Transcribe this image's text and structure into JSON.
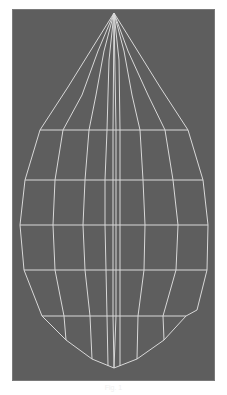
{
  "figure": {
    "type": "wireframe-mesh",
    "shape": "teardrop / leaf",
    "colors": {
      "background": "#ffffff",
      "viewport": "#5e5e5e",
      "wire": "#d8d8d8"
    },
    "apex": [
      114,
      13
    ],
    "bottom_tip": [
      114,
      368
    ],
    "rings": [
      {
        "y": 130,
        "points": [
          [
            40,
            130
          ],
          [
            63,
            130
          ],
          [
            89,
            130
          ],
          [
            107,
            130
          ],
          [
            113,
            130
          ],
          [
            116,
            130
          ],
          [
            120,
            130
          ],
          [
            140,
            130
          ],
          [
            165,
            130
          ],
          [
            188,
            130
          ]
        ]
      },
      {
        "y": 180,
        "points": [
          [
            25,
            180
          ],
          [
            55,
            180
          ],
          [
            85,
            180
          ],
          [
            105,
            180
          ],
          [
            113,
            180
          ],
          [
            116,
            180
          ],
          [
            120,
            180
          ],
          [
            143,
            180
          ],
          [
            173,
            180
          ],
          [
            203,
            180
          ]
        ]
      },
      {
        "y": 225,
        "points": [
          [
            20,
            225
          ],
          [
            53,
            225
          ],
          [
            83,
            225
          ],
          [
            105,
            225
          ],
          [
            113,
            225
          ],
          [
            116,
            225
          ],
          [
            120,
            225
          ],
          [
            145,
            225
          ],
          [
            178,
            225
          ],
          [
            208,
            225
          ]
        ]
      },
      {
        "y": 270,
        "points": [
          [
            24,
            270
          ],
          [
            55,
            270
          ],
          [
            85,
            270
          ],
          [
            106,
            270
          ],
          [
            113,
            270
          ],
          [
            116,
            270
          ],
          [
            120,
            270
          ],
          [
            144,
            270
          ],
          [
            176,
            270
          ],
          [
            207,
            270
          ]
        ]
      },
      {
        "y": 316,
        "points": [
          [
            42,
            316
          ],
          [
            64,
            316
          ],
          [
            90,
            316
          ],
          [
            107,
            316
          ],
          [
            113,
            316
          ],
          [
            116,
            316
          ],
          [
            120,
            316
          ],
          [
            138,
            316
          ],
          [
            163,
            316
          ],
          [
            186,
            316
          ]
        ]
      }
    ],
    "meridians": [
      [
        [
          114,
          13
        ],
        [
          68,
          87
        ],
        [
          40,
          130
        ],
        [
          25,
          180
        ],
        [
          20,
          225
        ],
        [
          24,
          270
        ],
        [
          42,
          316
        ],
        [
          66,
          340
        ],
        [
          92,
          359
        ],
        [
          114,
          368
        ]
      ],
      [
        [
          114,
          13
        ],
        [
          98,
          51
        ],
        [
          82,
          95
        ],
        [
          63,
          130
        ],
        [
          55,
          180
        ],
        [
          53,
          225
        ],
        [
          55,
          270
        ],
        [
          64,
          316
        ],
        [
          66,
          340
        ]
      ],
      [
        [
          114,
          13
        ],
        [
          104,
          51
        ],
        [
          96,
          95
        ],
        [
          89,
          130
        ],
        [
          85,
          180
        ],
        [
          83,
          225
        ],
        [
          85,
          270
        ],
        [
          90,
          316
        ],
        [
          92,
          359
        ]
      ],
      [
        [
          114,
          13
        ],
        [
          109,
          60
        ],
        [
          107,
          130
        ],
        [
          105,
          180
        ],
        [
          105,
          225
        ],
        [
          106,
          270
        ],
        [
          107,
          316
        ],
        [
          108,
          366
        ]
      ],
      [
        [
          114,
          13
        ],
        [
          113,
          130
        ],
        [
          113,
          225
        ],
        [
          113,
          316
        ],
        [
          114,
          368
        ]
      ],
      [
        [
          114,
          13
        ],
        [
          116,
          130
        ],
        [
          116,
          225
        ],
        [
          116,
          316
        ],
        [
          114,
          368
        ]
      ],
      [
        [
          114,
          13
        ],
        [
          119,
          60
        ],
        [
          120,
          130
        ],
        [
          120,
          180
        ],
        [
          120,
          225
        ],
        [
          120,
          270
        ],
        [
          120,
          316
        ],
        [
          120,
          366
        ]
      ],
      [
        [
          114,
          13
        ],
        [
          124,
          51
        ],
        [
          132,
          95
        ],
        [
          140,
          130
        ],
        [
          143,
          180
        ],
        [
          145,
          225
        ],
        [
          144,
          270
        ],
        [
          138,
          316
        ],
        [
          137,
          359
        ]
      ],
      [
        [
          114,
          13
        ],
        [
          128,
          51
        ],
        [
          148,
          95
        ],
        [
          165,
          130
        ],
        [
          173,
          180
        ],
        [
          178,
          225
        ],
        [
          176,
          270
        ],
        [
          163,
          316
        ],
        [
          164,
          340
        ]
      ],
      [
        [
          114,
          13
        ],
        [
          160,
          87
        ],
        [
          188,
          130
        ],
        [
          203,
          180
        ],
        [
          208,
          225
        ],
        [
          207,
          270
        ],
        [
          197,
          310
        ],
        [
          186,
          316
        ],
        [
          164,
          340
        ],
        [
          137,
          359
        ],
        [
          114,
          368
        ]
      ]
    ],
    "caption": "Fig. 1"
  }
}
